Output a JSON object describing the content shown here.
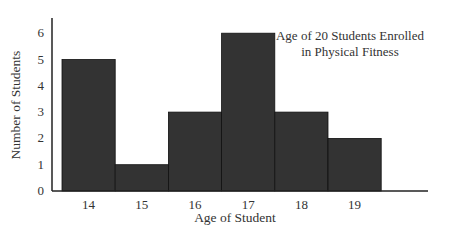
{
  "chart_data": {
    "type": "bar",
    "title": "Age of 20 Students Enrolled in Physical Fitness",
    "title_lines": [
      "Age of 20 Students Enrolled",
      "in Physical Fitness"
    ],
    "xlabel": "Age of Student",
    "ylabel": "Number of Students",
    "categories": [
      "14",
      "15",
      "16",
      "17",
      "18",
      "19"
    ],
    "values": [
      5,
      1,
      3,
      6,
      3,
      2
    ],
    "ylim": [
      0,
      6
    ],
    "yticks": [
      "0",
      "1",
      "2",
      "3",
      "4",
      "5",
      "6"
    ],
    "grid": false,
    "legend": null,
    "bar_color": "#333333"
  }
}
